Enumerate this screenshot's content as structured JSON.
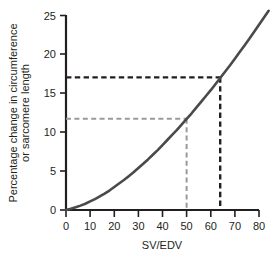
{
  "chart_data": {
    "type": "line",
    "title": "",
    "subtitle": "",
    "xlabel": "SV/EDV",
    "ylabel": "Percentage change in circumference or sarcomere length",
    "ylabel_line1": "Percentage change in circumference",
    "ylabel_line2": "or sarcomere length",
    "xlim": [
      0,
      80
    ],
    "ylim": [
      0,
      25
    ],
    "xticks": [
      0,
      10,
      20,
      30,
      40,
      50,
      60,
      70,
      80
    ],
    "yticks": [
      0,
      5,
      10,
      15,
      20,
      25
    ],
    "xtick_labels": [
      "0",
      "10",
      "20",
      "30",
      "40",
      "50",
      "60",
      "70",
      "80"
    ],
    "ytick_labels": [
      "0",
      "5",
      "10",
      "15",
      "20",
      "25"
    ],
    "grid": false,
    "legend": "none",
    "series": [
      {
        "name": "Percentage change vs SV/EDV",
        "color": "#4a4a4a",
        "linewidth": 2.6,
        "x": [
          0,
          2,
          4,
          6,
          8,
          10,
          12,
          14,
          16,
          18,
          20,
          22,
          24,
          26,
          28,
          30,
          32,
          34,
          36,
          38,
          40,
          42,
          44,
          46,
          48,
          50,
          52,
          54,
          56,
          58,
          60,
          62,
          64,
          66,
          68,
          70,
          72,
          74,
          76,
          78,
          80,
          82,
          84
        ],
        "values": [
          0.0,
          0.15,
          0.34,
          0.56,
          0.8,
          1.1,
          1.4,
          1.75,
          2.1,
          2.5,
          2.95,
          3.4,
          3.85,
          4.35,
          4.85,
          5.4,
          5.95,
          6.5,
          7.1,
          7.7,
          8.35,
          9.0,
          9.65,
          10.3,
          11.0,
          11.7,
          12.4,
          13.15,
          13.9,
          14.65,
          15.4,
          16.2,
          17.0,
          17.8,
          18.6,
          19.45,
          20.3,
          21.15,
          22.0,
          22.9,
          23.8,
          24.7,
          25.6
        ]
      }
    ],
    "annotations": [
      {
        "name": "reference-dashed-dark",
        "color": "#231f20",
        "style": "dashed",
        "x": 64,
        "y": 17.0,
        "horizontal_from_x": 0,
        "vertical_to_y": 0
      },
      {
        "name": "reference-dashed-gray",
        "color": "#9a9a9a",
        "style": "dashed",
        "x": 50,
        "y": 11.7,
        "horizontal_from_x": 0,
        "vertical_to_y": 0
      }
    ],
    "axis_color": "#231f20"
  }
}
